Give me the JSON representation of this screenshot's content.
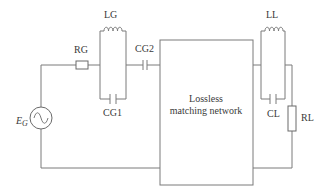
{
  "diagram": {
    "type": "circuit-schematic",
    "components": {
      "source": {
        "label_main": "E",
        "label_sub": "G",
        "symbol": "ac-voltage-source"
      },
      "rg": {
        "label": "RG",
        "symbol": "resistor"
      },
      "lg": {
        "label": "LG",
        "symbol": "inductor"
      },
      "cg1": {
        "label": "CG1",
        "symbol": "capacitor"
      },
      "cg2": {
        "label": "CG2",
        "symbol": "capacitor"
      },
      "network": {
        "line1": "Lossless",
        "line2": "matching network",
        "symbol": "block"
      },
      "ll": {
        "label": "LL",
        "symbol": "inductor"
      },
      "cl": {
        "label": "CL",
        "symbol": "capacitor"
      },
      "rl": {
        "label": "RL",
        "symbol": "resistor"
      }
    },
    "colors": {
      "wire": "#7a7a7a",
      "text": "#3a3a3a",
      "background": "#ffffff"
    }
  }
}
